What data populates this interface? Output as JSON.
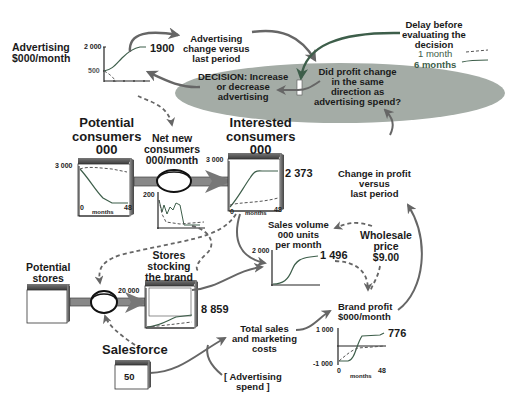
{
  "diagram": {
    "colors": {
      "ellipse_fill": "#a4aca6",
      "arrow_gray": "#666666",
      "green_line": "#3d5e4a",
      "stock_top": "#555555"
    }
  },
  "advertising": {
    "label_line1": "Advertising",
    "label_line2": "$000/month",
    "y_max": "2 000",
    "y_min": "500",
    "value": "1900"
  },
  "advertising_change": {
    "line1": "Advertising",
    "line2": "change versus",
    "line3": "last period"
  },
  "delay_legend": {
    "line1": "Delay before",
    "line2": "evaluating the",
    "line3": "decision",
    "item1": "1 month",
    "item2": "6 months"
  },
  "decision": {
    "left_line1": "DECISION: Increase",
    "left_line2": "or decrease",
    "left_line3": "advertising",
    "right_line1": "Did profit change",
    "right_line2": "in the same",
    "right_line3": "direction as",
    "right_line4": "advertising spend?"
  },
  "potential_consumers": {
    "line1": "Potential",
    "line2": "consumers",
    "line3": "000",
    "y_max": "3 000",
    "x_min": "0",
    "x_max": "48",
    "x_label": "months"
  },
  "net_new_consumers": {
    "line1": "Net new",
    "line2": "consumers",
    "line3": "000/month",
    "y_max": "200"
  },
  "interested_consumers": {
    "line1": "Interested",
    "line2": "consumers",
    "line3": "000",
    "y_max": "3 000",
    "x_min": "0",
    "x_max": "48",
    "x_label": "months",
    "value": "2 373"
  },
  "change_in_profit": {
    "line1": "Change in profit",
    "line2": "versus",
    "line3": "last period"
  },
  "sales_volume": {
    "line1": "Sales volume",
    "line2": "000 units",
    "line3": "per month",
    "y_max": "2 000",
    "value": "1 496"
  },
  "wholesale_price": {
    "line1": "Wholesale",
    "line2": "price",
    "line3": "$9.00"
  },
  "potential_stores": {
    "line1": "Potential",
    "line2": "stores"
  },
  "stores_stocking": {
    "line1": "Stores",
    "line2": "stocking",
    "line3": "the brand",
    "y_max": "20 000",
    "value": "8 859"
  },
  "brand_profit": {
    "line1": "Brand profit",
    "line2": "$000/month",
    "y_max": "1 000",
    "y_min": "-1 000",
    "x_min": "0",
    "x_max": "48",
    "x_label": "months",
    "value": "776"
  },
  "total_costs": {
    "line1": "Total sales",
    "line2": "and marketing",
    "line3": "costs"
  },
  "advertising_spend": {
    "line1": "[ Advertising",
    "line2": "spend ]"
  },
  "salesforce": {
    "label": "Salesforce",
    "value": "50"
  }
}
